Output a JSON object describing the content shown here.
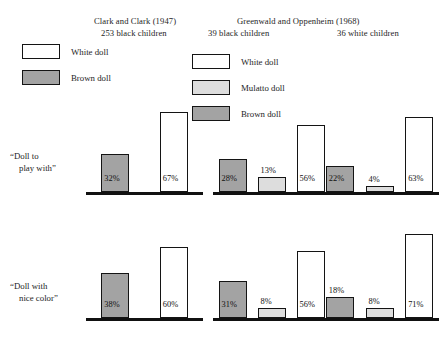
{
  "figure": {
    "studies": [
      {
        "id": "clark",
        "title": "Clark and Clark (1947)",
        "sample": "253 black children"
      },
      {
        "id": "greenwald",
        "title": "Greenwald and Oppenheim (1968)",
        "sample_black": "39 black children",
        "sample_white": "36 white children"
      }
    ],
    "legends": [
      {
        "id": "legend-left",
        "items": [
          {
            "label": "White doll",
            "swatch": "white",
            "color": "#ffffff"
          },
          {
            "label": "Brown doll",
            "swatch": "brown",
            "color": "#a3a3a3"
          }
        ]
      },
      {
        "id": "legend-right",
        "items": [
          {
            "label": "White doll",
            "swatch": "white",
            "color": "#ffffff"
          },
          {
            "label": "Mulatto doll",
            "swatch": "mulatto",
            "color": "#dddddd"
          },
          {
            "label": "Brown doll",
            "swatch": "brown",
            "color": "#a3a3a3"
          }
        ]
      }
    ],
    "row_labels": [
      {
        "line1": "“Doll to",
        "line2": "play with”"
      },
      {
        "line1": "“Doll with",
        "line2": "nice color”"
      }
    ]
  },
  "chart_data": {
    "type": "bar",
    "xlabel": "",
    "ylabel": "Percent of children choosing doll",
    "ylim": [
      0,
      80
    ],
    "grid": false,
    "legend_position": "top",
    "value_format": "percent",
    "groups": [
      {
        "study": "Clark and Clark (1947)",
        "sample": "253 black children",
        "categories": [
          "Brown doll",
          "White doll"
        ],
        "rows": [
          {
            "question": "“Doll to play with”",
            "values": [
              32,
              67
            ],
            "labels": [
              "32%",
              "67%"
            ]
          },
          {
            "question": "“Doll with nice color”",
            "values": [
              38,
              60
            ],
            "labels": [
              "38%",
              "60%"
            ]
          }
        ]
      },
      {
        "study": "Greenwald and Oppenheim (1968)",
        "sample": "39 black children",
        "categories": [
          "Brown doll",
          "Mulatto doll",
          "White doll"
        ],
        "rows": [
          {
            "question": "“Doll to play with”",
            "values": [
              28,
              13,
              56
            ],
            "labels": [
              "28%",
              "13%",
              "56%"
            ]
          },
          {
            "question": "“Doll with nice color”",
            "values": [
              31,
              8,
              56
            ],
            "labels": [
              "31%",
              "8%",
              "56%"
            ]
          }
        ]
      },
      {
        "study": "Greenwald and Oppenheim (1968)",
        "sample": "36 white children",
        "categories": [
          "Brown doll",
          "Mulatto doll",
          "White doll"
        ],
        "rows": [
          {
            "question": "“Doll to play with”",
            "values": [
              22,
              4,
              63
            ],
            "labels": [
              "22%",
              "4%",
              "63%"
            ]
          },
          {
            "question": "“Doll with nice color”",
            "values": [
              18,
              8,
              71
            ],
            "labels": [
              "18%",
              "8%",
              "71%"
            ]
          }
        ]
      }
    ]
  }
}
